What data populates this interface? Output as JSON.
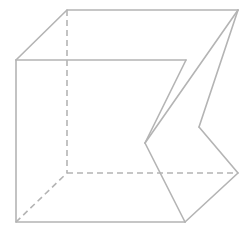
{
  "figure": {
    "stroke_color": "#b4b4b4",
    "background": "#ffffff",
    "vertices": {
      "A_front_top_left": [
        16,
        60
      ],
      "B_front_top_right": [
        186,
        60
      ],
      "C_back_top_left": [
        67,
        10
      ],
      "D_back_top_right": [
        238,
        10
      ],
      "E_front_bottom_left": [
        16,
        222
      ],
      "F_front_bottom_right": [
        185,
        222
      ],
      "G_back_bottom_left": [
        67,
        173
      ],
      "H_back_bottom_right": [
        238,
        173
      ],
      "K1_fold_left": [
        145,
        143
      ],
      "K2_fold_right": [
        199,
        127
      ]
    }
  }
}
